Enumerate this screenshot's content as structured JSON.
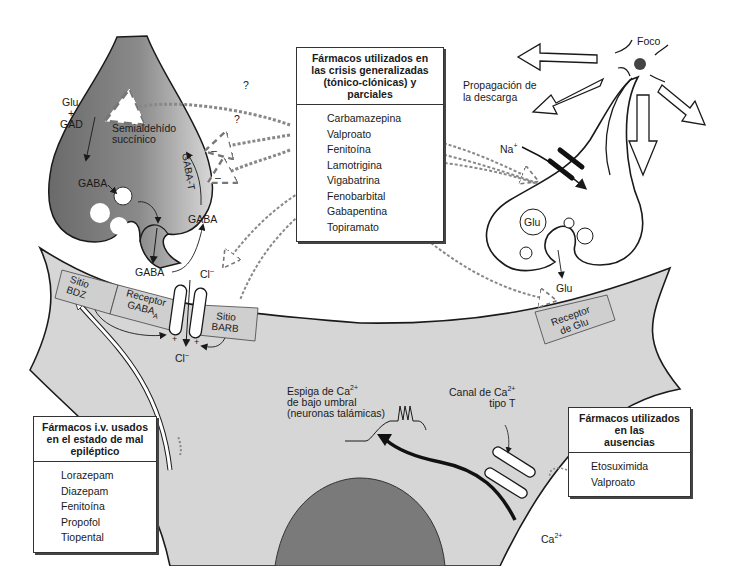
{
  "figure": {
    "presynaptic_gaba_terminal": {
      "glu": "Glu",
      "plus": "+",
      "gad": "GAD",
      "gaba_top": "GABA",
      "semialdehido": "Semialdehído",
      "succinico": "succínico",
      "gaba_t": "GABA-T",
      "minus1": "–",
      "minus2": "–",
      "gaba_right": "GABA",
      "gaba_cleft": "GABA",
      "question1": "?",
      "question2": "?"
    },
    "postsynaptic_membrane": {
      "sitio_bdz": [
        "Sitio",
        "BDZ"
      ],
      "receptor_gaba": [
        "Receptor",
        "GABA",
        "A"
      ],
      "sitio_barb": [
        "Sitio",
        "BARB"
      ],
      "cl_top": "Cl",
      "cl_bottom": "Cl",
      "cl_charge": "–",
      "plus_left": "+",
      "plus_right": "+",
      "receptor_glu": [
        "Receptor",
        "de Glu"
      ]
    },
    "glutamatergic_terminal": {
      "foco": "Foco",
      "propagacion": [
        "Propagación de",
        "la descarga"
      ],
      "na": "Na",
      "na_charge": "+",
      "glu_vesicle": "Glu",
      "glu_release": "Glu"
    },
    "calcium": {
      "espiga": [
        "Espiga de Ca",
        "2+",
        "de bajo umbral",
        "(neuronas talámicas)"
      ],
      "canal": [
        "Canal de Ca",
        "2+",
        "tipo T"
      ],
      "ca_ion": [
        "Ca",
        "2+"
      ]
    }
  },
  "boxes": {
    "crisis_generalizadas": {
      "title": [
        "Fármacos utilizados en",
        "las crisis generalizadas",
        "(tónico-clónicas) y",
        "parciales"
      ],
      "drugs": [
        "Carbamazepina",
        "Valproato",
        "Fenitoína",
        "Lamotrigina",
        "Vigabatrina",
        "Fenobarbital",
        "Gabapentina",
        "Topiramato"
      ]
    },
    "mal_epileptico": {
      "title": [
        "Fármacos i.v. usados",
        "en el estado de mal",
        "epiléptico"
      ],
      "drugs": [
        "Lorazepam",
        "Diazepam",
        "Fenitoína",
        "Propofol",
        "Tiopental"
      ]
    },
    "ausencias": {
      "title": [
        "Fármacos utilizados",
        "en las",
        "ausencias"
      ],
      "drugs": [
        "Etosuximida",
        "Valproato"
      ]
    }
  },
  "colors": {
    "neuron_fill": "#d4d4d4",
    "terminal_dark": "#6e6e6e",
    "terminal_light": "#c8c8c8",
    "nucleus": "#7a7a7a",
    "line": "#1a1a1a"
  }
}
